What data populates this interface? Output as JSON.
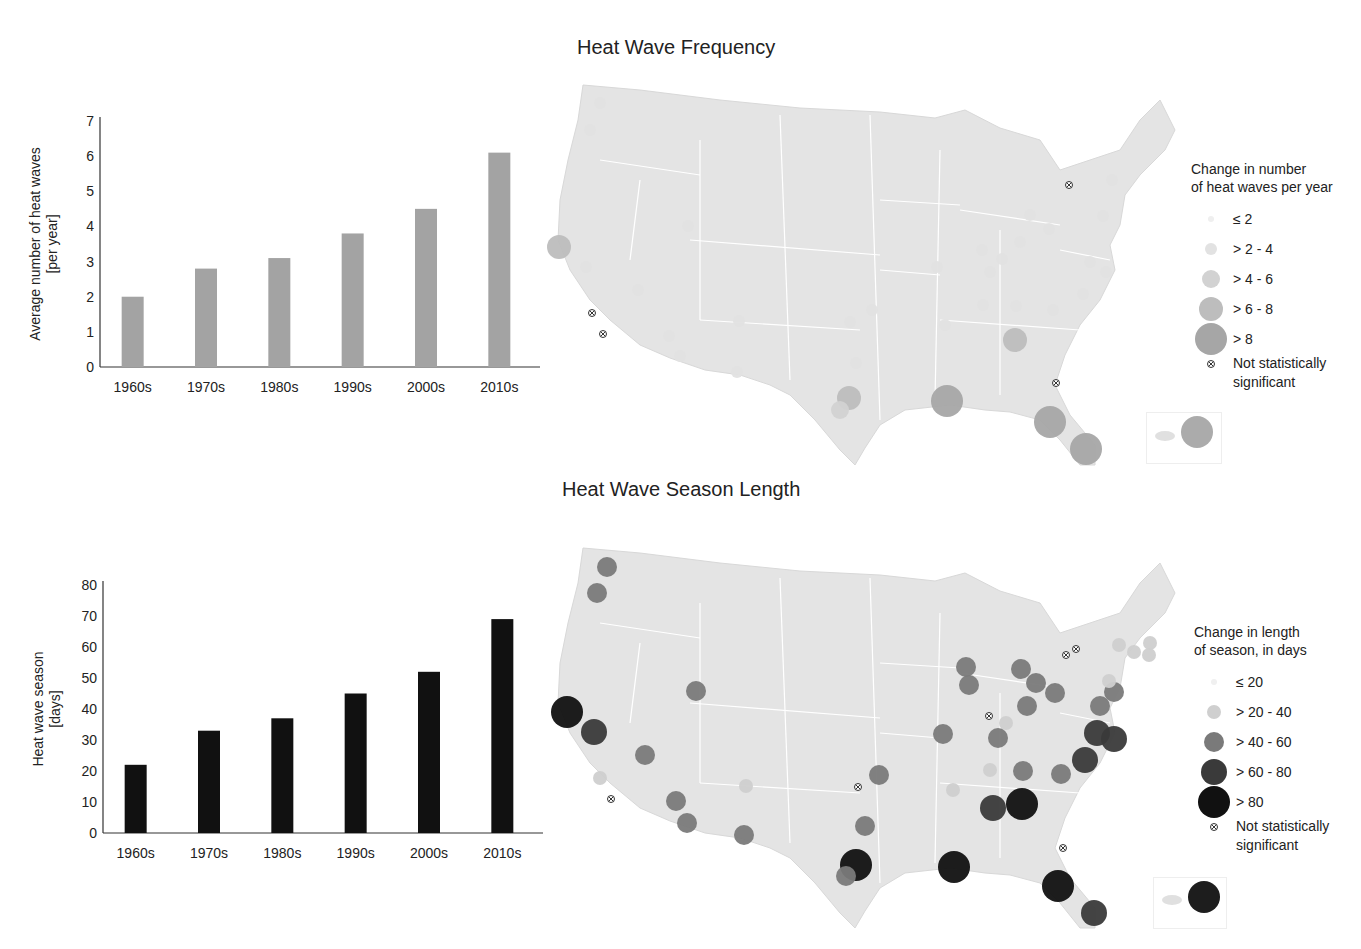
{
  "colors": {
    "bar_frequency": "#a3a3a3",
    "bar_season": "#111111",
    "map_fill": "#e4e4e4",
    "map_border": "#ffffff"
  },
  "top": {
    "map_title": "Heat Wave Frequency",
    "legend": {
      "title_line1": "Change in number",
      "title_line2": "of heat waves per year",
      "items": [
        {
          "label": "≤ 2",
          "r": 3,
          "color": "#efefef"
        },
        {
          "label": "> 2 - 4",
          "r": 6,
          "color": "#e2e2e2"
        },
        {
          "label": "> 4 - 6",
          "r": 9,
          "color": "#d2d2d2"
        },
        {
          "label": "> 6 - 8",
          "r": 12,
          "color": "#bdbdbd"
        },
        {
          "label": "> 8",
          "r": 16,
          "color": "#a6a6a6"
        }
      ],
      "not_significant_line1": "Not statistically",
      "not_significant_line2": "significant"
    }
  },
  "bottom": {
    "map_title": "Heat Wave Season Length",
    "legend": {
      "title_line1": "Change in length",
      "title_line2": "of season, in days",
      "items": [
        {
          "label": "≤ 20",
          "r": 3,
          "color": "#f0f0f0"
        },
        {
          "label": "> 20 - 40",
          "r": 7,
          "color": "#cfcfcf"
        },
        {
          "label": "> 40 - 60",
          "r": 10,
          "color": "#7a7a7a"
        },
        {
          "label": "> 60 - 80",
          "r": 13,
          "color": "#3a3a3a"
        },
        {
          "label": "> 80",
          "r": 16,
          "color": "#111111"
        }
      ],
      "not_significant_line1": "Not statistically",
      "not_significant_line2": "significant"
    }
  },
  "chart_data": [
    {
      "type": "bar",
      "title": "",
      "categories": [
        "1960s",
        "1970s",
        "1980s",
        "1990s",
        "2000s",
        "2010s"
      ],
      "values": [
        2.0,
        2.8,
        3.1,
        3.8,
        4.5,
        6.1
      ],
      "xlabel": "",
      "ylabel": "Average number of heat waves [per year]",
      "ylabel_line1": "Average number of heat waves",
      "ylabel_line2": "[per year]",
      "ylim": [
        0,
        7
      ],
      "yticks": [
        0,
        1,
        2,
        3,
        4,
        5,
        6,
        7
      ],
      "grid": false,
      "color": "#a3a3a3"
    },
    {
      "type": "bar",
      "title": "",
      "categories": [
        "1960s",
        "1970s",
        "1980s",
        "1990s",
        "2000s",
        "2010s"
      ],
      "values": [
        22,
        33,
        37,
        45,
        52,
        69
      ],
      "xlabel": "",
      "ylabel": "Heat wave season [days]",
      "ylabel_line1": "Heat wave season",
      "ylabel_line2": "[days]",
      "ylim": [
        0,
        80
      ],
      "yticks": [
        0,
        10,
        20,
        30,
        40,
        50,
        60,
        70,
        80
      ],
      "grid": false,
      "color": "#111111"
    },
    {
      "type": "scatter",
      "title": "Heat Wave Frequency",
      "legend_title": "Change in number of heat waves per year",
      "classes": [
        "≤ 2",
        "> 2 - 4",
        "> 4 - 6",
        "> 6 - 8",
        "> 8",
        "Not statistically significant"
      ],
      "points": [
        {
          "x": 600,
          "y": 103,
          "c": 1
        },
        {
          "x": 590,
          "y": 130,
          "c": 1
        },
        {
          "x": 559,
          "y": 247,
          "c": 3
        },
        {
          "x": 586,
          "y": 267,
          "c": 1
        },
        {
          "x": 638,
          "y": 290,
          "c": 1
        },
        {
          "x": 592,
          "y": 313,
          "c": 5
        },
        {
          "x": 603,
          "y": 334,
          "c": 5
        },
        {
          "x": 688,
          "y": 226,
          "c": 1
        },
        {
          "x": 669,
          "y": 336,
          "c": 1
        },
        {
          "x": 680,
          "y": 356,
          "c": 1
        },
        {
          "x": 739,
          "y": 321,
          "c": 1
        },
        {
          "x": 737,
          "y": 372,
          "c": 1
        },
        {
          "x": 850,
          "y": 322,
          "c": 1
        },
        {
          "x": 872,
          "y": 310,
          "c": 1
        },
        {
          "x": 856,
          "y": 363,
          "c": 1
        },
        {
          "x": 849,
          "y": 398,
          "c": 3
        },
        {
          "x": 840,
          "y": 410,
          "c": 2
        },
        {
          "x": 947,
          "y": 401,
          "c": 4
        },
        {
          "x": 1015,
          "y": 340,
          "c": 3
        },
        {
          "x": 1050,
          "y": 422,
          "c": 4
        },
        {
          "x": 1086,
          "y": 449,
          "c": 4
        },
        {
          "x": 1056,
          "y": 383,
          "c": 5
        },
        {
          "x": 1069,
          "y": 185,
          "c": 5
        },
        {
          "x": 982,
          "y": 250,
          "c": 1
        },
        {
          "x": 1020,
          "y": 242,
          "c": 1
        },
        {
          "x": 1002,
          "y": 259,
          "c": 1
        },
        {
          "x": 1030,
          "y": 215,
          "c": 1
        },
        {
          "x": 1049,
          "y": 229,
          "c": 1
        },
        {
          "x": 1103,
          "y": 216,
          "c": 1
        },
        {
          "x": 1106,
          "y": 272,
          "c": 1
        },
        {
          "x": 1090,
          "y": 262,
          "c": 1
        },
        {
          "x": 1083,
          "y": 294,
          "c": 1
        },
        {
          "x": 983,
          "y": 305,
          "c": 1
        },
        {
          "x": 1016,
          "y": 306,
          "c": 1
        },
        {
          "x": 1053,
          "y": 310,
          "c": 1
        },
        {
          "x": 937,
          "y": 267,
          "c": 1
        },
        {
          "x": 990,
          "y": 272,
          "c": 1
        },
        {
          "x": 945,
          "y": 325,
          "c": 1
        },
        {
          "x": 1112,
          "y": 180,
          "c": 1
        },
        {
          "x": 1197,
          "y": 432,
          "c": 4
        }
      ]
    },
    {
      "type": "scatter",
      "title": "Heat Wave Season Length",
      "legend_title": "Change in length of season, in days",
      "classes": [
        "≤ 20",
        "> 20 - 40",
        "> 40 - 60",
        "> 60 - 80",
        "> 80",
        "Not statistically significant"
      ],
      "points": [
        {
          "x": 607,
          "y": 567,
          "c": 2
        },
        {
          "x": 597,
          "y": 593,
          "c": 2
        },
        {
          "x": 567,
          "y": 712,
          "c": 4
        },
        {
          "x": 594,
          "y": 732,
          "c": 3
        },
        {
          "x": 645,
          "y": 755,
          "c": 2
        },
        {
          "x": 600,
          "y": 778,
          "c": 1
        },
        {
          "x": 611,
          "y": 799,
          "c": 5
        },
        {
          "x": 696,
          "y": 691,
          "c": 2
        },
        {
          "x": 676,
          "y": 801,
          "c": 2
        },
        {
          "x": 687,
          "y": 823,
          "c": 2
        },
        {
          "x": 744,
          "y": 835,
          "c": 2
        },
        {
          "x": 746,
          "y": 786,
          "c": 1
        },
        {
          "x": 879,
          "y": 775,
          "c": 2
        },
        {
          "x": 858,
          "y": 787,
          "c": 5
        },
        {
          "x": 865,
          "y": 826,
          "c": 2
        },
        {
          "x": 856,
          "y": 865,
          "c": 4
        },
        {
          "x": 846,
          "y": 876,
          "c": 2
        },
        {
          "x": 954,
          "y": 867,
          "c": 4
        },
        {
          "x": 966,
          "y": 667,
          "c": 2
        },
        {
          "x": 969,
          "y": 685,
          "c": 2
        },
        {
          "x": 943,
          "y": 734,
          "c": 2
        },
        {
          "x": 989,
          "y": 716,
          "c": 5
        },
        {
          "x": 1006,
          "y": 723,
          "c": 1
        },
        {
          "x": 998,
          "y": 738,
          "c": 2
        },
        {
          "x": 1021,
          "y": 669,
          "c": 2
        },
        {
          "x": 1036,
          "y": 683,
          "c": 2
        },
        {
          "x": 1055,
          "y": 693,
          "c": 2
        },
        {
          "x": 1027,
          "y": 706,
          "c": 2
        },
        {
          "x": 1066,
          "y": 655,
          "c": 5
        },
        {
          "x": 1076,
          "y": 649,
          "c": 5
        },
        {
          "x": 1114,
          "y": 692,
          "c": 2
        },
        {
          "x": 1100,
          "y": 706,
          "c": 2
        },
        {
          "x": 1097,
          "y": 733,
          "c": 3
        },
        {
          "x": 1114,
          "y": 739,
          "c": 3
        },
        {
          "x": 1085,
          "y": 760,
          "c": 3
        },
        {
          "x": 1061,
          "y": 774,
          "c": 2
        },
        {
          "x": 1023,
          "y": 771,
          "c": 2
        },
        {
          "x": 990,
          "y": 770,
          "c": 1
        },
        {
          "x": 953,
          "y": 790,
          "c": 1
        },
        {
          "x": 993,
          "y": 808,
          "c": 3
        },
        {
          "x": 1022,
          "y": 804,
          "c": 4
        },
        {
          "x": 1063,
          "y": 848,
          "c": 5
        },
        {
          "x": 1058,
          "y": 886,
          "c": 4
        },
        {
          "x": 1094,
          "y": 913,
          "c": 3
        },
        {
          "x": 1119,
          "y": 645,
          "c": 1
        },
        {
          "x": 1134,
          "y": 652,
          "c": 1
        },
        {
          "x": 1150,
          "y": 643,
          "c": 1
        },
        {
          "x": 1149,
          "y": 655,
          "c": 1
        },
        {
          "x": 1109,
          "y": 681,
          "c": 1
        },
        {
          "x": 1204,
          "y": 897,
          "c": 4
        }
      ]
    }
  ]
}
